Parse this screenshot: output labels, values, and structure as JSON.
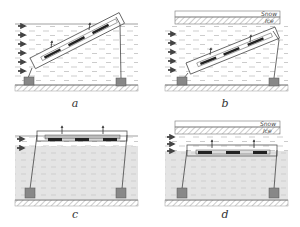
{
  "figure": {
    "colors": {
      "line": "#555555",
      "fill_dark": "#888888",
      "water_dash": "#9a9a9a",
      "water_deep": "#e2e2e2",
      "ground": "#bbbbbb",
      "module": "#222222"
    },
    "panels": [
      {
        "id": "a",
        "caption": "a",
        "layout": "inclined",
        "ice_cover": false
      },
      {
        "id": "b",
        "caption": "b",
        "layout": "inclined",
        "ice_cover": true,
        "ice_labels": {
          "snow": "Snow",
          "ice": "Ice"
        }
      },
      {
        "id": "c",
        "caption": "c",
        "layout": "horizontal-surface",
        "ice_cover": false
      },
      {
        "id": "d",
        "caption": "d",
        "layout": "horizontal-submerged",
        "ice_cover": true,
        "ice_labels": {
          "snow": "Snow",
          "ice": "Ice"
        }
      }
    ]
  }
}
